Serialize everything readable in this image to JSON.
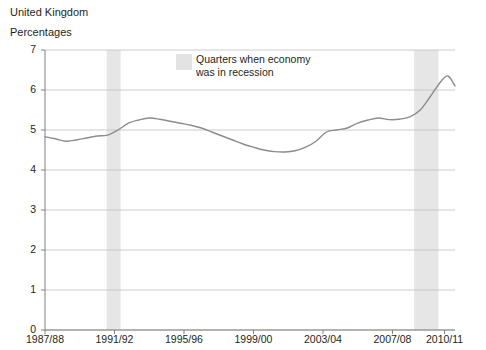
{
  "header": {
    "country": "United Kingdom",
    "units": "Percentages"
  },
  "legend": {
    "line1": "Quarters when economy",
    "line2": "was in recession",
    "swatch_color": "#e3e3e3"
  },
  "colors": {
    "line": "#8c8c8c",
    "grid": "#bfbfbf",
    "axis": "#808080",
    "recession_band": "#e6e6e6",
    "text": "#231f20",
    "background": "#ffffff"
  },
  "chart_data": {
    "type": "line",
    "title": "United Kingdom",
    "subtitle": "Percentages",
    "xlabel": "",
    "ylabel": "Percentages",
    "ylim": [
      0,
      7
    ],
    "yticks": [
      0,
      1,
      2,
      3,
      4,
      5,
      6,
      7
    ],
    "ytick_labels": [
      "0",
      "1",
      "2",
      "3",
      "4",
      "5",
      "6",
      "7"
    ],
    "grid": true,
    "legend_position": "top-center",
    "xtick_labels": [
      "1987/88",
      "1991/92",
      "1995/96",
      "1999/00",
      "2003/04",
      "2007/08",
      "2010/11"
    ],
    "xtick_values": [
      1987,
      1991,
      1995,
      1999,
      2003,
      2007,
      2010
    ],
    "xlim": [
      1987,
      2010.6
    ],
    "series": [
      {
        "name": "Percentage",
        "x": [
          1987.0,
          1987.6,
          1988.2,
          1988.8,
          1989.4,
          1990.0,
          1990.6,
          1991.2,
          1991.8,
          1992.4,
          1993.0,
          1993.6,
          1994.2,
          1994.8,
          1995.4,
          1996.0,
          1996.6,
          1997.2,
          1997.8,
          1998.4,
          1999.0,
          1999.6,
          2000.2,
          2000.8,
          2001.4,
          2002.0,
          2002.6,
          2003.2,
          2003.8,
          2004.4,
          2005.0,
          2005.6,
          2006.2,
          2006.8,
          2007.4,
          2008.0,
          2008.6,
          2009.2,
          2009.8,
          2010.2,
          2010.6
        ],
        "values": [
          4.83,
          4.78,
          4.72,
          4.75,
          4.8,
          4.85,
          4.87,
          5.0,
          5.17,
          5.25,
          5.3,
          5.27,
          5.22,
          5.17,
          5.12,
          5.05,
          4.95,
          4.85,
          4.75,
          4.65,
          4.57,
          4.5,
          4.46,
          4.45,
          4.48,
          4.57,
          4.72,
          4.95,
          5.0,
          5.05,
          5.17,
          5.25,
          5.3,
          5.26,
          5.27,
          5.33,
          5.5,
          5.85,
          6.22,
          6.35,
          6.1
        ]
      }
    ],
    "recession_bands": [
      {
        "start": 1990.55,
        "end": 1991.35,
        "label": "Quarters when economy was in recession"
      },
      {
        "start": 2008.25,
        "end": 2009.65,
        "label": "Quarters when economy was in recession"
      }
    ],
    "legend_entries": [
      {
        "label": "Quarters when economy was in recession",
        "color": "#e6e6e6",
        "type": "band"
      }
    ]
  }
}
